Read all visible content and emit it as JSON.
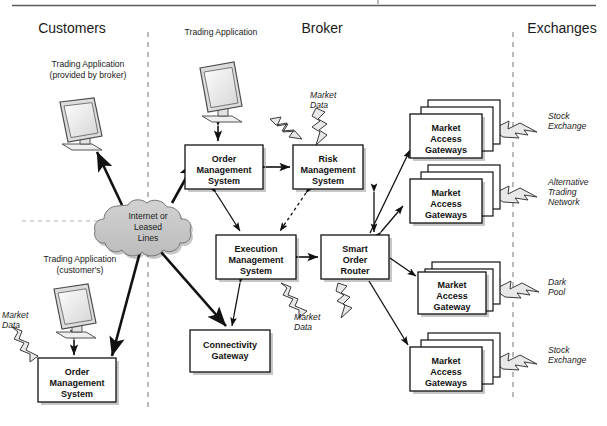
{
  "figure": {
    "top_rule": true,
    "columns": [
      {
        "id": "customers",
        "label": "Customers"
      },
      {
        "id": "broker",
        "label": "Broker"
      },
      {
        "id": "exchanges",
        "label": "Exchanges"
      }
    ],
    "dividers": [
      {
        "id": "customers-broker-divider",
        "x": 148,
        "y1": 32,
        "y2": 412,
        "style": "dashed"
      },
      {
        "id": "broker-exchanges-divider",
        "x": 513,
        "y1": 32,
        "y2": 398,
        "style": "dashed"
      },
      {
        "id": "customer-tier-divider",
        "x1": 22,
        "x2": 112,
        "y": 221,
        "style": "dashed"
      }
    ],
    "monitors": [
      {
        "id": "customer-broker-provided-terminal",
        "caption": [
          "Trading Application",
          "(provided by broker)"
        ],
        "caption_align": "center",
        "caption_x": 88,
        "caption_y": 67,
        "x": 58,
        "y": 98
      },
      {
        "id": "broker-terminal",
        "caption": [
          "Trading Application"
        ],
        "caption_align": "center",
        "caption_x": 220,
        "caption_y": 35,
        "x": 198,
        "y": 62
      },
      {
        "id": "customer-own-terminal",
        "caption": [
          "Trading Application",
          "(customer's)"
        ],
        "caption_align": "center",
        "caption_x": 80,
        "caption_y": 262,
        "x": 52,
        "y": 284
      }
    ],
    "cloud": {
      "id": "network-cloud",
      "label": [
        "Internet or",
        "Leased",
        "Lines"
      ],
      "cx": 148,
      "cy": 224,
      "fill": "#c9c9c9"
    },
    "boxes": [
      {
        "id": "customer-oms",
        "label": [
          "Order",
          "Management",
          "System"
        ],
        "x": 38,
        "y": 358,
        "w": 78,
        "h": 44,
        "stack": 1
      },
      {
        "id": "broker-oms",
        "label": [
          "Order",
          "Management",
          "System"
        ],
        "x": 185,
        "y": 145,
        "w": 78,
        "h": 44,
        "stack": 1
      },
      {
        "id": "risk-management-system",
        "label": [
          "Risk",
          "Management",
          "System"
        ],
        "x": 293,
        "y": 145,
        "w": 70,
        "h": 44,
        "stack": 1
      },
      {
        "id": "execution-management-system",
        "label": [
          "Execution",
          "Management",
          "System"
        ],
        "x": 216,
        "y": 235,
        "w": 80,
        "h": 44,
        "stack": 1
      },
      {
        "id": "smart-order-router",
        "label": [
          "Smart",
          "Order",
          "Router"
        ],
        "x": 321,
        "y": 235,
        "w": 68,
        "h": 44,
        "stack": 1
      },
      {
        "id": "connectivity-gateway",
        "label": [
          "Connectivity",
          "Gateway"
        ],
        "x": 190,
        "y": 330,
        "w": 80,
        "h": 42,
        "stack": 1
      },
      {
        "id": "market-access-gateways-stock-exchange-top",
        "label": [
          "Market",
          "Access",
          "Gateways"
        ],
        "x": 410,
        "y": 107,
        "w": 72,
        "h": 44,
        "stack": 3
      },
      {
        "id": "market-access-gateways-alternative-trading-network",
        "label": [
          "Market",
          "Access",
          "Gateways"
        ],
        "x": 410,
        "y": 172,
        "w": 72,
        "h": 44,
        "stack": 3
      },
      {
        "id": "market-access-gateway-dark-pool",
        "label": [
          "Market",
          "Access",
          "Gateway"
        ],
        "x": 418,
        "y": 266,
        "w": 68,
        "h": 42,
        "stack": 2
      },
      {
        "id": "market-access-gateways-stock-exchange-bottom",
        "label": [
          "Market",
          "Access",
          "Gateways"
        ],
        "x": 410,
        "y": 340,
        "w": 72,
        "h": 44,
        "stack": 3
      }
    ],
    "annotations": [
      {
        "id": "market-data-broker-top",
        "text": [
          "Market",
          "Data"
        ],
        "x": 310,
        "y": 98,
        "align": "start",
        "style": "italic"
      },
      {
        "id": "market-data-ems-sor",
        "text": [
          "Market",
          "Data"
        ],
        "x": 294,
        "y": 316,
        "align": "start",
        "style": "italic"
      },
      {
        "id": "market-data-customer",
        "text": [
          "Market",
          "Data"
        ],
        "x": 2,
        "y": 315,
        "align": "start",
        "style": "italic"
      }
    ],
    "venue_labels": [
      {
        "id": "venue-stock-exchange-top",
        "text": [
          "Stock",
          "Exchange"
        ],
        "x": 548,
        "y": 116,
        "style": "italic"
      },
      {
        "id": "venue-alternative-trading-network",
        "text": [
          "Alternative",
          "Trading",
          "Network"
        ],
        "x": 548,
        "y": 182,
        "style": "italic"
      },
      {
        "id": "venue-dark-pool",
        "text": [
          "Dark",
          "Pool"
        ],
        "x": 548,
        "y": 282,
        "style": "italic"
      },
      {
        "id": "venue-stock-exchange-bottom",
        "text": [
          "Stock",
          "Exchange"
        ],
        "x": 548,
        "y": 350,
        "style": "italic"
      }
    ],
    "column_header_positions": {
      "customers": 72,
      "broker": 322,
      "exchanges": 562,
      "y": 33
    }
  }
}
